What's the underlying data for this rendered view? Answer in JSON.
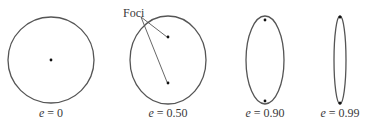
{
  "diagram": {
    "foci_label": "Foci",
    "stroke_color": "#555555",
    "shapes": [
      {
        "name": "circle",
        "label_var": "e",
        "label_eq": " = ",
        "label_val": "0",
        "cx": 51,
        "cy": 60,
        "rx": 43,
        "ry": 43,
        "foci": [
          [
            51,
            60
          ]
        ]
      },
      {
        "name": "ellipse-0.50",
        "label_var": "e",
        "label_eq": " = ",
        "label_val": "0.50",
        "cx": 168,
        "cy": 60,
        "rx": 38,
        "ry": 44,
        "foci": [
          [
            168,
            38
          ],
          [
            168,
            83
          ]
        ]
      },
      {
        "name": "ellipse-0.90",
        "label_var": "e",
        "label_eq": " = ",
        "label_val": "0.90",
        "cx": 265,
        "cy": 60,
        "rx": 19,
        "ry": 44,
        "foci": [
          [
            265,
            20
          ],
          [
            265,
            101
          ]
        ]
      },
      {
        "name": "ellipse-0.99",
        "label_var": "e",
        "label_eq": " = ",
        "label_val": "0.99",
        "cx": 340,
        "cy": 60,
        "rx": 6,
        "ry": 44,
        "foci": [
          [
            340,
            17
          ],
          [
            340,
            103
          ]
        ]
      }
    ]
  }
}
